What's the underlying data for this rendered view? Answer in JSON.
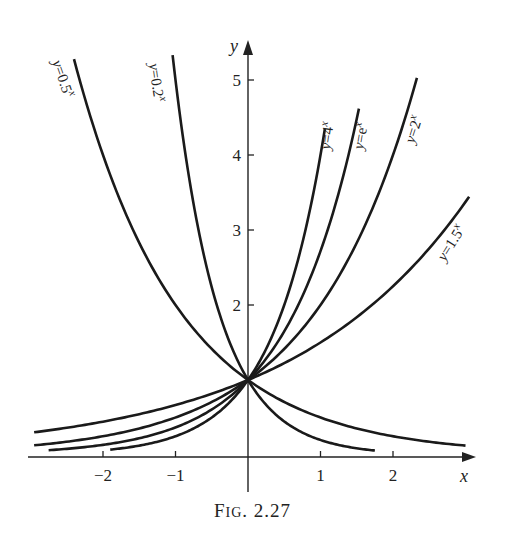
{
  "chart_data": {
    "type": "line",
    "title": "",
    "xlabel": "x",
    "ylabel": "y",
    "xlim": [
      -2.9,
      3.1
    ],
    "ylim": [
      0,
      5.3
    ],
    "x_ticks": [
      -2,
      -1,
      1,
      2
    ],
    "x_tick_labels": [
      "−2",
      "−1",
      "1",
      "2"
    ],
    "y_ticks": [
      2,
      3,
      4,
      5
    ],
    "y_tick_labels": [
      "2",
      "3",
      "4",
      "5"
    ],
    "grid": false,
    "legend": "inline labels along curves",
    "series": [
      {
        "name": "y=0.5^x",
        "label": "y=0.5",
        "sup": "x",
        "base": 0.5,
        "x_range": [
          -2.4,
          3.0
        ]
      },
      {
        "name": "y=0.2^x",
        "label": "y=0.2",
        "sup": "x",
        "base": 0.2,
        "x_range": [
          -1.04,
          1.75
        ]
      },
      {
        "name": "y=4^x",
        "label": "y=4",
        "sup": "x",
        "base": 4,
        "x_range": [
          -1.9,
          1.06
        ]
      },
      {
        "name": "y=e^x",
        "label": "y=e",
        "sup": "x",
        "base": 2.718281828,
        "x_range": [
          -2.75,
          1.53
        ]
      },
      {
        "name": "y=2^x",
        "label": "y=2",
        "sup": "x",
        "base": 2,
        "x_range": [
          -2.95,
          2.33
        ]
      },
      {
        "name": "y=1.5^x",
        "label": "y=1.5",
        "sup": "x",
        "base": 1.5,
        "x_range": [
          -2.95,
          3.05
        ]
      }
    ],
    "caption": "FIG. 2.27"
  },
  "caption": {
    "prefix": "F",
    "smallcaps": "IG",
    "rest": ". 2.27"
  }
}
